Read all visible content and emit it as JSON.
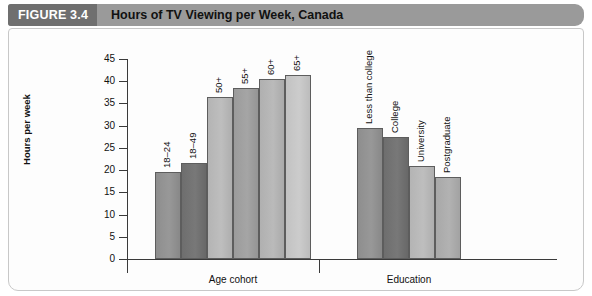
{
  "figure": {
    "number_label": "FIGURE 3.4",
    "title": "Hours of TV Viewing per Week, Canada"
  },
  "chart_data": {
    "type": "bar",
    "title": "Hours of TV Viewing per Week, Canada",
    "xlabel": "",
    "ylabel": "Hours per week",
    "ylim": [
      0,
      45
    ],
    "ytick_step": 5,
    "yticks": [
      0,
      5,
      10,
      15,
      20,
      25,
      30,
      35,
      40,
      45
    ],
    "ytick_labels": [
      "0",
      "5",
      "10",
      "15",
      "20",
      "25",
      "30",
      "35",
      "40",
      "45"
    ],
    "grid": false,
    "legend": "none",
    "groups": [
      {
        "name": "Age cohort",
        "categories": [
          "18–24",
          "18–49",
          "50+",
          "55+",
          "60+",
          "65+"
        ],
        "values": [
          19.5,
          21.5,
          36.5,
          38.5,
          40.5,
          41.5
        ],
        "colors": [
          "#8e8e8e",
          "#6e6e6e",
          "#b4b4b4",
          "#9b9b9b",
          "#b0b0b0",
          "#c2c2c2"
        ]
      },
      {
        "name": "Education",
        "categories": [
          "Less than college",
          "College",
          "University",
          "Postgraduate"
        ],
        "values": [
          29.5,
          27.5,
          21.0,
          18.5
        ],
        "colors": [
          "#8e8e8e",
          "#6e6e6e",
          "#b4b4b4",
          "#a8a8a8"
        ]
      }
    ]
  },
  "style": {
    "header_dark": "#6f6f6f",
    "header_light": "#9a9a9a",
    "axis_color": "#3a3a3a",
    "panel_bg": "#fdfdfd"
  }
}
